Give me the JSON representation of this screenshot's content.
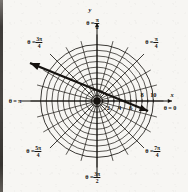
{
  "figure": {
    "kind": "polar-coordinate-grid",
    "background_color": "#f7f6f3",
    "ink_color": "#15120f"
  },
  "chart_data": {
    "type": "scatter",
    "title": "",
    "subtitle": "",
    "coordinate_system": "polar",
    "xlabel": "x",
    "ylabel": "y",
    "grid": true,
    "legend_position": "none",
    "center": {
      "x": 97,
      "y": 101
    },
    "radial_axis": {
      "label": "r",
      "rlim": [
        0,
        11
      ],
      "outer_radius_value": 11,
      "outer_radius_px": 62,
      "circle_count": 10,
      "circle_values": [
        1,
        2,
        3,
        4,
        5,
        6,
        7,
        8,
        9,
        10
      ],
      "tick_labels_below_axis": [
        "2",
        "4",
        "6"
      ],
      "tick_labels_above_axis": [
        "8",
        "10"
      ],
      "tick_values_below_axis": [
        2,
        4,
        6
      ],
      "tick_values_above_axis": [
        8,
        10
      ]
    },
    "angular_axis": {
      "spoke_count": 24,
      "spoke_step_degrees": 15,
      "labeled_directions": [
        {
          "id": "theta-0",
          "text_prefix": "θ =",
          "value": "0",
          "is_fraction": false,
          "numerator": "",
          "denominator": "",
          "degrees": 0,
          "lx": 170,
          "ly": 108
        },
        {
          "id": "theta-pi-4",
          "text_prefix": "θ =",
          "value": "",
          "is_fraction": true,
          "numerator": "π",
          "denominator": "4",
          "degrees": 45,
          "lx": 152,
          "ly": 43
        },
        {
          "id": "theta-pi-2",
          "text_prefix": "θ =",
          "value": "",
          "is_fraction": true,
          "numerator": "π",
          "denominator": "2",
          "degrees": 90,
          "lx": 93,
          "ly": 24
        },
        {
          "id": "theta-3pi-4",
          "text_prefix": "θ =",
          "value": "",
          "is_fraction": true,
          "numerator": "3π",
          "denominator": "4",
          "degrees": 135,
          "lx": 35,
          "ly": 43
        },
        {
          "id": "theta-pi",
          "text_prefix": "θ =",
          "value": "π",
          "is_fraction": false,
          "numerator": "",
          "denominator": "",
          "degrees": 180,
          "lx": 15,
          "ly": 101
        },
        {
          "id": "theta-5pi-4",
          "text_prefix": "θ =",
          "value": "",
          "is_fraction": true,
          "numerator": "5π",
          "denominator": "4",
          "degrees": 225,
          "lx": 34,
          "ly": 152
        },
        {
          "id": "theta-3pi-2",
          "text_prefix": "θ =",
          "value": "",
          "is_fraction": true,
          "numerator": "3π",
          "denominator": "2",
          "degrees": 270,
          "lx": 93,
          "ly": 178
        },
        {
          "id": "theta-7pi-4",
          "text_prefix": "θ =",
          "value": "",
          "is_fraction": true,
          "numerator": "7π",
          "denominator": "4",
          "degrees": 315,
          "lx": 153,
          "ly": 152
        }
      ]
    },
    "cartesian_axes": {
      "x_axis_label": "x",
      "y_axis_label": "y",
      "x_label_pos": {
        "x": 172,
        "y": 95
      },
      "y_label_pos": {
        "x": 90,
        "y": 10
      }
    },
    "annotations": [
      {
        "id": "direction-vector",
        "kind": "double-headed-arrow",
        "description": "bold straight line through the origin with arrowheads at both ends",
        "from": {
          "x": 148,
          "y": 111
        },
        "to": {
          "x": 30,
          "y": 63
        },
        "passes_through_origin": true,
        "stroke_width": 2.4
      }
    ]
  }
}
